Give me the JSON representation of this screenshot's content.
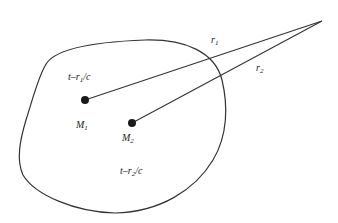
{
  "diagram": {
    "colors": {
      "stroke": "#333333",
      "dot": "#1a1a1a",
      "text": "#222222",
      "background": "#ffffff"
    },
    "region": {
      "name": "source-region"
    },
    "points": [
      {
        "id": "M1",
        "label": "M",
        "subscript": "1",
        "x": 85,
        "y": 100
      },
      {
        "id": "M2",
        "label": "M",
        "subscript": "2",
        "x": 132,
        "y": 123
      }
    ],
    "observation_point": {
      "x": 322,
      "y": 21
    },
    "lines": [
      {
        "id": "r1",
        "from": "M1",
        "to": "observation_point",
        "label": "r",
        "subscript": "1"
      },
      {
        "id": "r2",
        "from": "M2",
        "to": "observation_point",
        "label": "r",
        "subscript": "2"
      }
    ],
    "time_labels": [
      {
        "id": "t1",
        "prefix": "t–r",
        "subscript": "1",
        "suffix": "/c"
      },
      {
        "id": "t2",
        "prefix": "t–r",
        "subscript": "2",
        "suffix": "/c"
      }
    ]
  }
}
